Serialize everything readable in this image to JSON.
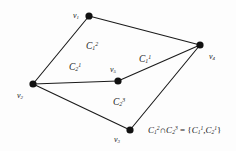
{
  "figure": {
    "kind": "graph-diagram",
    "width": 236,
    "height": 151,
    "background_color": "#fdfdfd",
    "stroke_color": "#1a1a1a",
    "vertex_color": "#111111"
  },
  "vertices": [
    {
      "id": "v1",
      "label_html": "v<sub>1</sub>",
      "x": 89,
      "y": 16,
      "label_x": 73,
      "label_y": 12,
      "radius": 3.6
    },
    {
      "id": "v2",
      "label_html": "v<sub>2</sub>",
      "x": 33,
      "y": 84,
      "label_x": 17,
      "label_y": 92,
      "radius": 3.6
    },
    {
      "id": "v3",
      "label_html": "v<sub>3</sub>",
      "x": 130,
      "y": 130,
      "label_x": 114,
      "label_y": 136,
      "radius": 3.6
    },
    {
      "id": "v4",
      "label_html": "v<sub>4</sub>",
      "x": 200,
      "y": 45,
      "label_x": 209,
      "label_y": 53,
      "radius": 3.6
    },
    {
      "id": "v5",
      "label_html": "v<sub>5</sub>",
      "x": 118,
      "y": 81,
      "label_x": 110,
      "label_y": 66,
      "radius": 3.6
    }
  ],
  "edges": [
    {
      "from": "v2",
      "to": "v1"
    },
    {
      "from": "v1",
      "to": "v4"
    },
    {
      "from": "v2",
      "to": "v5"
    },
    {
      "from": "v5",
      "to": "v4"
    },
    {
      "from": "v2",
      "to": "v3"
    },
    {
      "from": "v3",
      "to": "v4"
    }
  ],
  "face_labels": [
    {
      "id": "c12",
      "label_html": "C<sub>1</sub><sup>2</sup>",
      "x": 86,
      "y": 42
    },
    {
      "id": "c11",
      "label_html": "C<sub>1</sub><sup>1</sup>",
      "x": 139,
      "y": 55
    },
    {
      "id": "c21",
      "label_html": "C<sub>2</sub><sup>1</sup>",
      "x": 69,
      "y": 63
    },
    {
      "id": "c23",
      "label_html": "C<sub>2</sub><sup>3</sup>",
      "x": 113,
      "y": 98
    }
  ],
  "equation": {
    "id": "intersection-equation",
    "x": 148,
    "y": 126,
    "html": "C<sub>1</sub><sup>2</sup><span class=\"op\">&#8745;</span>C<sub>2</sub><sup>3</sup> <span class=\"op\">=</span> <span class=\"op\">{</span>C<sub>1</sub><sup>1</sup><span class=\"op\">,</span>C<sub>2</sub><sup>1</sup><span class=\"op\">}</span>",
    "text": "C1^2 ∩ C2^3 = {C1^1, C2^1}"
  }
}
